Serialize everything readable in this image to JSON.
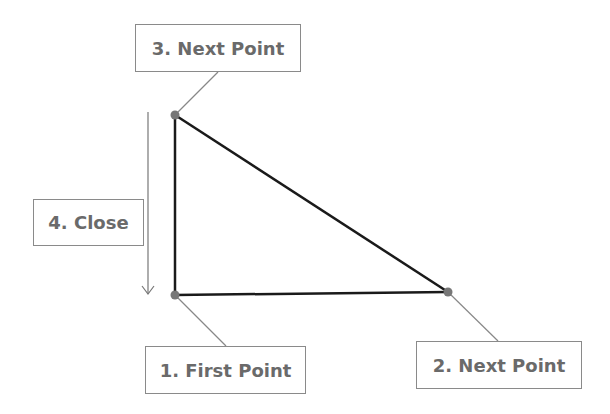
{
  "diagram": {
    "points": [
      {
        "id": 1,
        "x": 175,
        "y": 295
      },
      {
        "id": 2,
        "x": 448,
        "y": 292
      },
      {
        "id": 3,
        "x": 175,
        "y": 115
      }
    ],
    "labels": {
      "first_point": "1. First Point",
      "next_point_2": "2. Next Point",
      "next_point_3": "3. Next Point",
      "close": "4. Close"
    },
    "colors": {
      "edge": "#1a1a1a",
      "vertex": "#777777",
      "leader": "#888888",
      "label_text": "#6a6a6a",
      "label_border": "#8a8a8a"
    }
  }
}
